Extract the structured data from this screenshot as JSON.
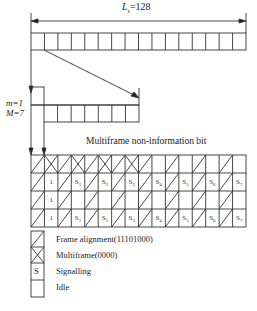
{
  "top_dimension": {
    "symbol": "L",
    "subscript": "s",
    "value": "=128"
  },
  "top_row": {
    "cells": 16
  },
  "submultiframe": {
    "m_label": "m=1",
    "M_label": "M=7",
    "cells": 7
  },
  "grid_title": "Multiframe non-information bit",
  "grid": {
    "columns": 16,
    "rows": [
      [
        "FA",
        "MF",
        "FA",
        "MF",
        "FA",
        "MF",
        "FA",
        "MF",
        "FA",
        "",
        "FA",
        "",
        "FA",
        "",
        "FA",
        ""
      ],
      [
        "FA",
        "1",
        "FA",
        "S1",
        "FA",
        "S2",
        "FA",
        "S3",
        "FA",
        "S4",
        "FA",
        "S5",
        "FA",
        "S6",
        "FA",
        "S7"
      ],
      [
        "FA",
        "1",
        "FA",
        "",
        "FA",
        "",
        "FA",
        "",
        "FA",
        "",
        "FA",
        "",
        "FA",
        "",
        "FA",
        ""
      ],
      [
        "FA",
        "1",
        "FA",
        "S1",
        "FA",
        "S2",
        "FA",
        "S3",
        "FA",
        "S4",
        "FA",
        "S5",
        "FA",
        "S6",
        "FA",
        "S7"
      ]
    ],
    "text_cells": {
      "r1c1": "1",
      "r1c3": "S1",
      "r1c5": "S2",
      "r1c7": "S3",
      "r1c9": "S4",
      "r1c11": "S5",
      "r1c13": "S6",
      "r1c15": "S7",
      "r2c1": "1",
      "r3c1": "1",
      "r3c3": "S1",
      "r3c5": "S2",
      "r3c7": "S3",
      "r3c9": "S4",
      "r3c11": "S5",
      "r3c13": "S6",
      "r3c15": "S7"
    }
  },
  "legend": {
    "items": [
      {
        "symbol": "diagonal",
        "label": "Frame alignment(11101000)"
      },
      {
        "symbol": "cross",
        "label": "Multiframe(0000)"
      },
      {
        "symbol": "S",
        "label": "Signalling"
      },
      {
        "symbol": "empty",
        "label": "Idle"
      }
    ]
  }
}
